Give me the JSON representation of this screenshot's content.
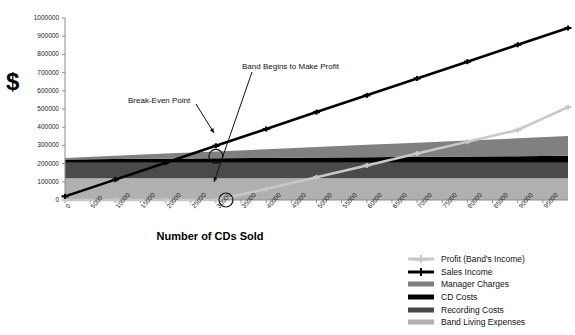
{
  "chart_data": {
    "type": "area",
    "title": "",
    "subtitle": "",
    "xlabel": "Number of CDs Sold",
    "ylabel": "$",
    "xlim": [
      0,
      100000
    ],
    "ylim": [
      0,
      1000000
    ],
    "grid": false,
    "legend_position": "bottom-right",
    "x_ticks": [
      0,
      5000,
      10000,
      15000,
      20000,
      25000,
      30000,
      35000,
      40000,
      45000,
      50000,
      55000,
      60000,
      65000,
      70000,
      75000,
      80000,
      85000,
      90000,
      95000
    ],
    "x_tick_labels": [
      "0",
      "5000",
      "10000",
      "15000",
      "20000",
      "25000",
      "30000",
      "35000",
      "40000",
      "45000",
      "50000",
      "55000",
      "60000",
      "65000",
      "70000",
      "75000",
      "80000",
      "85000",
      "90000",
      "95000"
    ],
    "y_ticks": [
      0,
      100000,
      200000,
      300000,
      400000,
      500000,
      600000,
      700000,
      800000,
      900000,
      1000000
    ],
    "y_tick_labels": [
      "0",
      "100000",
      "200000",
      "300000",
      "400000",
      "500000",
      "600000",
      "700000",
      "800000",
      "900000",
      "1000000"
    ],
    "x": [
      0,
      10000,
      20000,
      30000,
      40000,
      50000,
      60000,
      70000,
      80000,
      90000,
      100000
    ],
    "series": [
      {
        "name": "Band Living Expenses",
        "kind": "stacked-area",
        "color": "#b0b0b0",
        "stack_order": 1,
        "values": [
          120000,
          120000,
          120000,
          120000,
          120000,
          120000,
          120000,
          120000,
          120000,
          120000,
          120000
        ]
      },
      {
        "name": "Recording Costs",
        "kind": "stacked-area",
        "color": "#4a4a4a",
        "stack_order": 2,
        "values": [
          85000,
          85000,
          85000,
          85000,
          85000,
          85000,
          85000,
          85000,
          85000,
          85000,
          85000
        ]
      },
      {
        "name": "CD Costs",
        "kind": "stacked-area",
        "color": "#000000",
        "stack_order": 3,
        "values": [
          18000,
          20000,
          22000,
          24000,
          26000,
          28000,
          30000,
          32000,
          34000,
          36000,
          38000
        ]
      },
      {
        "name": "Manager Charges",
        "kind": "stacked-area",
        "color": "#808080",
        "stack_order": 4,
        "values": [
          8000,
          18000,
          28000,
          38000,
          48000,
          58000,
          68000,
          78000,
          88000,
          98000,
          108000
        ]
      },
      {
        "name": "Sales Income",
        "kind": "line",
        "color": "#000000",
        "marker": "plus",
        "values": [
          20000,
          112000,
          205000,
          298000,
          390000,
          483000,
          575000,
          668000,
          760000,
          853000,
          945000
        ]
      },
      {
        "name": "Profit (Band's Income)",
        "kind": "line",
        "color": "#c8c8c8",
        "marker": "plus",
        "values": [
          0,
          0,
          0,
          0,
          60000,
          125000,
          190000,
          255000,
          320000,
          385000,
          510000
        ]
      }
    ],
    "annotations": [
      {
        "id": "break-even-point",
        "text": "Break-Even Point",
        "marker": "circle",
        "point_x": 30000,
        "point_y": 240000
      },
      {
        "id": "band-begins-to-make-profit",
        "text": "Band Begins to Make Profit",
        "marker": "circle",
        "point_x": 32000,
        "point_y": 0
      }
    ]
  },
  "legend": {
    "items": [
      {
        "label": "Profit (Band's Income)",
        "color": "#c8c8c8",
        "style": "line-marker"
      },
      {
        "label": "Sales Income",
        "color": "#000000",
        "style": "line-marker"
      },
      {
        "label": "Manager Charges",
        "color": "#808080",
        "style": "swatch"
      },
      {
        "label": "CD Costs",
        "color": "#000000",
        "style": "swatch"
      },
      {
        "label": "Recording Costs",
        "color": "#4a4a4a",
        "style": "swatch"
      },
      {
        "label": "Band Living Expenses",
        "color": "#b0b0b0",
        "style": "swatch"
      }
    ]
  },
  "colors": {
    "axis": "#8c8c8c",
    "text": "#111111",
    "background": "#ffffff"
  }
}
